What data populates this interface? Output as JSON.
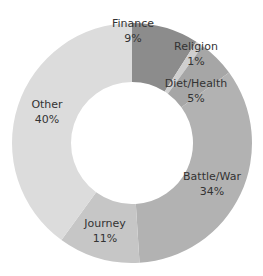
{
  "chart_data": {
    "type": "pie",
    "variant": "donut",
    "title": "",
    "categories": [
      "Finance",
      "Religion",
      "Diet/Health",
      "Battle/War",
      "Journey",
      "Other"
    ],
    "values": [
      9,
      1,
      5,
      34,
      11,
      40
    ],
    "unit": "%",
    "colors": [
      "#8c8c8c",
      "#cfcfcf",
      "#a6a6a6",
      "#b2b2b2",
      "#c6c6c6",
      "#dcdcdc"
    ],
    "start_angle": "12 o'clock",
    "direction": "clockwise",
    "legend": "none (inline data labels)",
    "labels": [
      {
        "name": "Finance",
        "pct": "9%",
        "x": 133,
        "y": 27
      },
      {
        "name": "Religion",
        "pct": "1%",
        "x": 196,
        "y": 50
      },
      {
        "name": "Diet/Health",
        "pct": "5%",
        "x": 196,
        "y": 87
      },
      {
        "name": "Battle/War",
        "pct": "34%",
        "x": 212,
        "y": 180
      },
      {
        "name": "Journey",
        "pct": "11%",
        "x": 105,
        "y": 227
      },
      {
        "name": "Other",
        "pct": "40%",
        "x": 47,
        "y": 108
      }
    ]
  }
}
